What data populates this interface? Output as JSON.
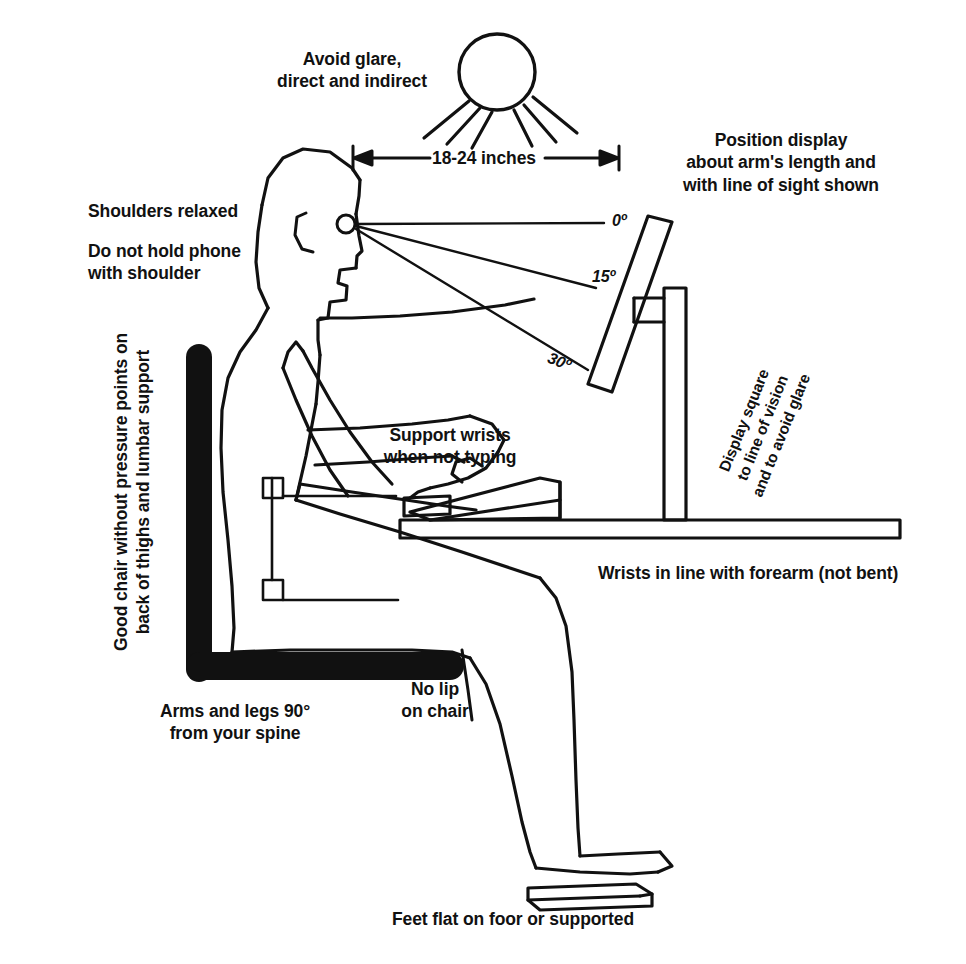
{
  "document": {
    "title": "Ergonomic Computer Workstation Setup",
    "type": "line-drawing-diagram",
    "ink_color": "#111111",
    "paper_color": "#ffffff"
  },
  "annotations": {
    "avoid_glare": "Avoid glare,\ndirect and indirect",
    "distance_dimension": "18-24 inches",
    "position_display": "Position display\nabout arm's length and\nwith line of sight shown",
    "shoulders_relaxed": "Shoulders relaxed",
    "no_phone_shoulder": "Do not hold phone\nwith shoulder",
    "good_chair": "Good chair without pressure points on\nback of thighs and lumbar support",
    "display_square": "Display square\nto line of vision\nand to avoid glare",
    "support_wrists": "Support wrists\nwhen not typing",
    "wrists_in_line": "Wrists in line with forearm (not bent)",
    "arms_legs_90": "Arms and legs 90°\nfrom your spine",
    "no_lip_on_chair": "No lip\non chair",
    "feet_flat": "Feet flat on foor or supported"
  },
  "sight_line_angles": [
    {
      "label": "0º",
      "value": 0,
      "unit": "degrees"
    },
    {
      "label": "15º",
      "value": 15,
      "unit": "degrees"
    },
    {
      "label": "30º",
      "value": 30,
      "unit": "degrees"
    }
  ],
  "measurements": {
    "viewing_distance_min_inches": 18,
    "viewing_distance_max_inches": 24,
    "body_angle_degrees": 90
  },
  "objects": [
    {
      "name": "glare-source-sun",
      "description": "overhead light with six rays"
    },
    {
      "name": "seated-person",
      "description": "side profile of seated worker"
    },
    {
      "name": "office-chair",
      "description": "thick L-shaped chair back and seat"
    },
    {
      "name": "monitor-display",
      "description": "tilted flat display on post"
    },
    {
      "name": "monitor-post",
      "description": "vertical support column"
    },
    {
      "name": "desk-surface",
      "description": "horizontal work surface"
    },
    {
      "name": "keyboard",
      "description": "angled keyboard"
    },
    {
      "name": "wrist-rest",
      "description": "wrist support block"
    },
    {
      "name": "footrest",
      "description": "angled foot support platform"
    },
    {
      "name": "right-angle-marker-elbow",
      "description": "90 degree square at elbow/hip"
    },
    {
      "name": "right-angle-marker-knee",
      "description": "90 degree square at knee"
    },
    {
      "name": "dimension-arrow",
      "description": "double headed arrow for viewing distance"
    }
  ]
}
